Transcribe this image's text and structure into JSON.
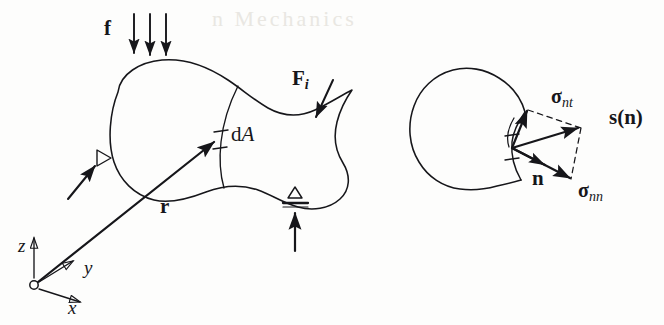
{
  "figure": {
    "kind": "continuum-mechanics-free-body-diagram",
    "background_color": "#fdfdfc",
    "ink_color": "#16161a",
    "ghost_color": "#e9e7e2"
  },
  "ghost_text": {
    "bleed_through": "n Mechanics"
  },
  "left_diagram": {
    "name": "loaded-body-with-supports",
    "labels": {
      "distributed_load": "f",
      "point_force": "F",
      "point_force_sub": "i",
      "area_element_d": "d",
      "area_element_a": "A",
      "position_vector": "r"
    },
    "axes": {
      "z": "z",
      "y": "y",
      "x": "x"
    },
    "load_arrow_count": 3,
    "support_count": 2
  },
  "right_diagram": {
    "name": "traction-vector-decomposition",
    "labels": {
      "shear_stress": "σ",
      "shear_stress_sub": "nt",
      "normal_stress": "σ",
      "normal_stress_sub": "nn",
      "traction_vector": "s(n)",
      "normal_vector": "n"
    }
  }
}
